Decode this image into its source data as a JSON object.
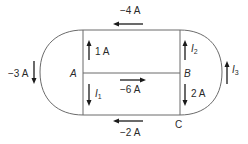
{
  "diagram": {
    "type": "circuit-currents",
    "nodes": [
      {
        "id": "A",
        "label": "A"
      },
      {
        "id": "B",
        "label": "B"
      },
      {
        "id": "C",
        "label": "C"
      }
    ],
    "currents": {
      "top": {
        "label": "−4 A",
        "direction": "left"
      },
      "middle": {
        "label": "−6 A",
        "direction": "right"
      },
      "bottom": {
        "label": "−2 A",
        "direction": "left"
      },
      "left_arc": {
        "label": "−3 A",
        "direction": "down"
      },
      "left_upper": {
        "label": "1 A",
        "direction": "up"
      },
      "left_lower": {
        "label": "I",
        "subscript": "1",
        "direction": "down"
      },
      "right_upper": {
        "label": "I",
        "subscript": "2",
        "direction": "up"
      },
      "right_lower": {
        "label": "2 A",
        "direction": "down"
      },
      "right_arc": {
        "label": "I",
        "subscript": "3",
        "direction": "up"
      }
    }
  }
}
